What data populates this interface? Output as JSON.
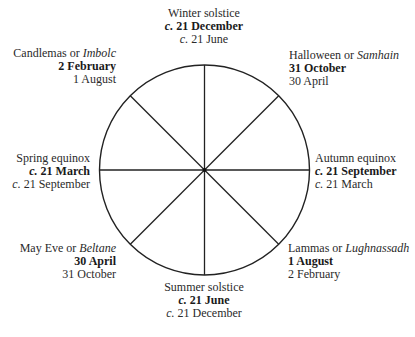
{
  "diagram": {
    "type": "wheel-of-the-year",
    "center": {
      "x": 204,
      "y": 170
    },
    "radius": 105,
    "stroke_color": "#222222",
    "spokes": 8,
    "labels": {
      "winter": {
        "name": "Winter solstice",
        "date_north": "c. 21 December",
        "date_south_prefix": "c.",
        "date_south": " 21 June"
      },
      "halloween": {
        "name": "Halloween or ",
        "name_alt": "Samhain",
        "date_north": "31 October",
        "date_south": "30 April"
      },
      "autumn": {
        "name": "Autumn equinox",
        "date_north_prefix": "c.",
        "date_north": " 21 September",
        "date_south_prefix": "c.",
        "date_south": " 21 March"
      },
      "lammas": {
        "name": "Lammas or ",
        "name_alt": "Lughnassadh",
        "date_north": "1 August",
        "date_south": "2 February"
      },
      "summer": {
        "name": "Summer solstice",
        "date_north_prefix": "c.",
        "date_north": " 21 June",
        "date_south_prefix": "c.",
        "date_south": " 21 December"
      },
      "mayeve": {
        "name": "May Eve or ",
        "name_alt": "Beltane",
        "date_north": "30 April",
        "date_south": "31 October"
      },
      "spring": {
        "name": "Spring equinox",
        "date_north_prefix": "c.",
        "date_north": " 21 March",
        "date_south_prefix": "c.",
        "date_south": " 21 September"
      },
      "candlemas": {
        "name": "Candlemas or ",
        "name_alt": "Imbolc",
        "date_north": "2 February",
        "date_south": "1 August"
      }
    }
  }
}
